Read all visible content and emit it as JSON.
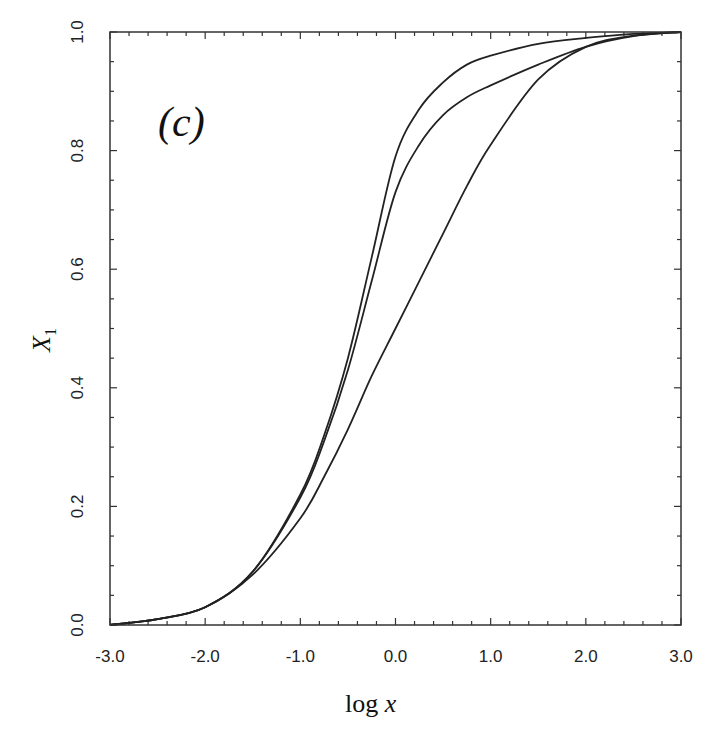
{
  "chart_data": {
    "type": "line",
    "title": "",
    "panel_label": "(c)",
    "xlabel": "log x",
    "ylabel": "X1",
    "ylabel_main": "X",
    "ylabel_sub": "1",
    "xlim": [
      -3.0,
      3.0
    ],
    "ylim": [
      0.0,
      1.0
    ],
    "x_ticks": [
      -3.0,
      -2.0,
      -1.0,
      0.0,
      1.0,
      2.0,
      3.0
    ],
    "x_tick_labels": [
      "-3.0",
      "-2.0",
      "-1.0",
      "0.0",
      "1.0",
      "2.0",
      "3.0"
    ],
    "y_ticks": [
      0.0,
      0.2,
      0.4,
      0.6,
      0.8,
      1.0
    ],
    "y_tick_labels": [
      "0.0",
      "0.2",
      "0.4",
      "0.6",
      "0.8",
      "1.0"
    ],
    "x_minor_step": 0.2,
    "y_minor_step": 0.05,
    "grid": false,
    "legend": null,
    "x": [
      -3.0,
      -2.5,
      -2.0,
      -1.5,
      -1.0,
      -0.75,
      -0.5,
      -0.25,
      0.0,
      0.25,
      0.5,
      0.75,
      1.0,
      1.5,
      2.0,
      2.5,
      3.0
    ],
    "series": [
      {
        "name": "curve-1",
        "values": [
          0.0,
          0.01,
          0.03,
          0.09,
          0.22,
          0.32,
          0.45,
          0.62,
          0.79,
          0.87,
          0.915,
          0.945,
          0.96,
          0.98,
          0.99,
          0.997,
          1.0
        ]
      },
      {
        "name": "curve-2",
        "values": [
          0.0,
          0.01,
          0.03,
          0.09,
          0.215,
          0.31,
          0.43,
          0.58,
          0.73,
          0.81,
          0.86,
          0.89,
          0.91,
          0.945,
          0.975,
          0.993,
          1.0
        ]
      },
      {
        "name": "curve-3",
        "values": [
          0.0,
          0.01,
          0.03,
          0.085,
          0.18,
          0.25,
          0.33,
          0.42,
          0.5,
          0.58,
          0.66,
          0.74,
          0.81,
          0.92,
          0.975,
          0.994,
          1.0
        ]
      }
    ]
  }
}
